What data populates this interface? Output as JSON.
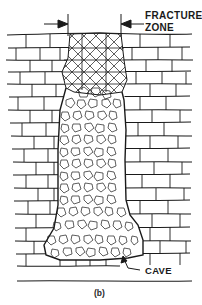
{
  "figure": {
    "caption": "(b)",
    "type": "geological cross-section",
    "labels": {
      "fracture_zone_line1": "FRACTURE",
      "fracture_zone_line2": "ZONE",
      "cave": "CAVE"
    },
    "elements": [
      {
        "name": "rock-strata",
        "description": "horizontally bedded blocky rock layers"
      },
      {
        "name": "fracture-zone",
        "description": "crosshatched fractured zone at top of collapse column"
      },
      {
        "name": "rubble-column",
        "description": "vertical collapse chimney filled with broken rock fragments"
      },
      {
        "name": "cave",
        "description": "void at base of rubble column"
      }
    ],
    "colors": {
      "ink": "#1a1a1a",
      "background": "#ffffff"
    }
  }
}
